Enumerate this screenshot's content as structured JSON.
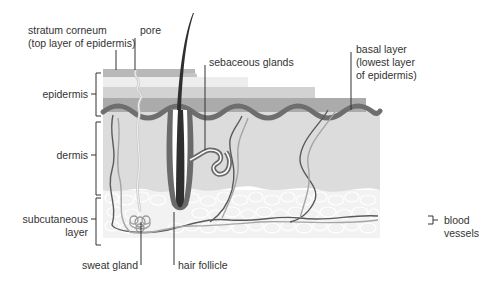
{
  "diagram": {
    "colors": {
      "stratum_corneum": "#b8b8b8",
      "epidermis_light": "#eeeeee",
      "epidermis_mid": "#d0d0d0",
      "epidermis_dark": "#a8a8a8",
      "basal_layer": "#6e6e6e",
      "dermis": "#dcdcdc",
      "subcutaneous": "#f2f2f2",
      "fat_cell_outline": "#ffffff",
      "hair": "#3a3a3a",
      "vessel_dark": "#5a5a5a",
      "vessel_light": "#a0a0a0",
      "label_text": "#333333",
      "leader_line": "#333333"
    },
    "labels": {
      "stratum_corneum": "stratum corneum\n(top layer of epidermis)",
      "pore": "pore",
      "sebaceous_glands": "sebaceous glands",
      "basal_layer": "basal layer\n(lowest layer\nof epidermis)",
      "epidermis": "epidermis",
      "dermis": "dermis",
      "subcutaneous_layer": "subcutaneous\nlayer",
      "sweat_gland": "sweat gland",
      "hair_follicle": "hair follicle",
      "blood_vessels": "blood\nvessels"
    }
  }
}
